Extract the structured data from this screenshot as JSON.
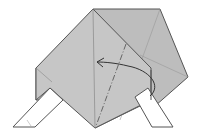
{
  "diagram": {
    "type": "origami-fold-step",
    "colors": {
      "paper_gray": "#c4c4c4",
      "paper_gray_back": "#b9b9b9",
      "paper_white": "#ffffff",
      "line": "#555555",
      "crease": "#8a8a8a",
      "background": "#ffffff"
    },
    "elements": [
      "back-flap",
      "main-diamond",
      "left-white-strip",
      "right-white-strip",
      "valley-fold-line",
      "fold-arrow"
    ]
  }
}
